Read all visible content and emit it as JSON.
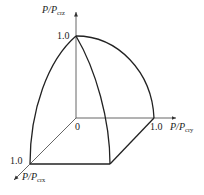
{
  "diagram": {
    "type": "3d-interaction-surface",
    "axes": {
      "z": {
        "label_main": "P/P",
        "label_sub": "crz",
        "tick": "1.0"
      },
      "y": {
        "label_main": "P/P",
        "label_sub": "cry",
        "tick": "1.0"
      },
      "x": {
        "label_main": "P/P",
        "label_sub": "crx",
        "tick": "1.0"
      }
    },
    "origin_label": "0",
    "colors": {
      "line": "#222222",
      "axis": "#555555",
      "background": "#ffffff"
    }
  }
}
